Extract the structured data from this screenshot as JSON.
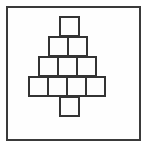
{
  "canvas": {
    "width_px": 148,
    "height_px": 148,
    "background_color": "#ffffff"
  },
  "frame": {
    "label": "border-rectangle",
    "stroke_color": "#3a3a3a",
    "stroke_width_px": 2,
    "fill_color": "#fefefe",
    "x_px": 6,
    "y_px": 6,
    "width_px": 135,
    "height_px": 135
  },
  "figure": {
    "name": "square-pyramid-with-trunk",
    "square_size_px": 21,
    "stroke_color": "#333333",
    "stroke_width_px": 2,
    "fill_color": "#fdfdfd",
    "total_squares": 11,
    "rows": [
      {
        "id": "row-1",
        "label": "apex-row",
        "count": 1,
        "left_px": 57,
        "top_px": 14
      },
      {
        "id": "row-2",
        "label": "second-row",
        "count": 2,
        "left_px": 46,
        "top_px": 34
      },
      {
        "id": "row-3",
        "label": "third-row",
        "count": 3,
        "left_px": 36,
        "top_px": 54
      },
      {
        "id": "row-4",
        "label": "base-row",
        "count": 4,
        "left_px": 26,
        "top_px": 74
      },
      {
        "id": "row-trunk",
        "label": "trunk-row",
        "count": 1,
        "left_px": 57,
        "top_px": 94
      }
    ]
  }
}
